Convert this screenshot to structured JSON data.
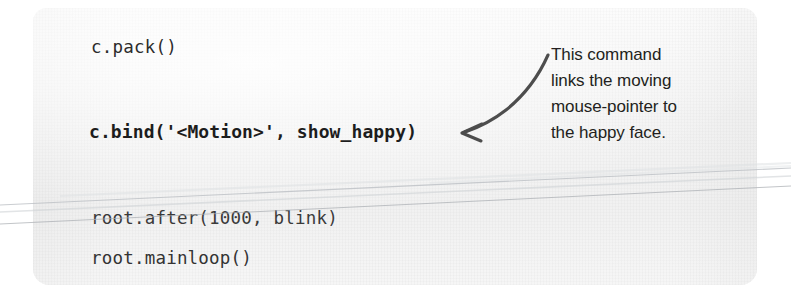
{
  "page": {
    "background_color": "#ffffff",
    "card_background_color": "#f2f2f2"
  },
  "code_block": {
    "language": "python",
    "lines": [
      {
        "text": "c.pack()",
        "bold": false
      },
      {
        "text": "c.bind('<Motion>', show_happy)",
        "bold": true
      },
      {
        "text": "root.after(1000, blink)",
        "bold": false
      },
      {
        "text": "root.mainloop()",
        "bold": false
      }
    ]
  },
  "annotation": {
    "text": "This command links the moving mouse-pointer to the happy face.",
    "lines": [
      "This command",
      "links the moving",
      "mouse-pointer to",
      "the happy face."
    ],
    "arrow": {
      "icon": "curved-arrow-left-icon",
      "color": "#4d4d4d",
      "direction": "left"
    },
    "text_color": "#231f20"
  }
}
